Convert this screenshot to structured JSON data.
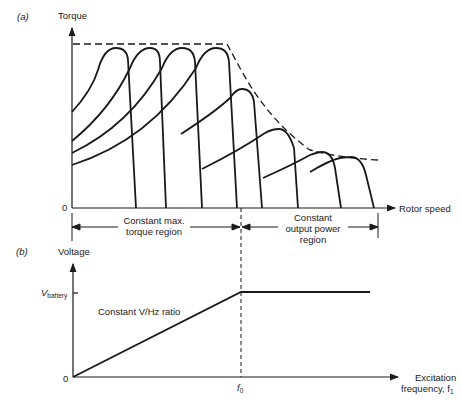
{
  "panel_a": {
    "tag": "(a)",
    "y_axis_label": "Torque",
    "x_axis_label": "Rotor speed",
    "origin_label": "0",
    "region_left": {
      "line1": "Constant max.",
      "line2": "torque region"
    },
    "region_right": {
      "line1": "Constant",
      "line2": "output power",
      "line3": "region"
    }
  },
  "panel_b": {
    "tag": "(b)",
    "y_axis_label": "Voltage",
    "y_tick_label": "V",
    "y_tick_sub": "battery",
    "x_axis_label_line1": "Excitation",
    "x_axis_label_line2": "frequency, f",
    "x_axis_label_sub": "1",
    "origin_label": "0",
    "x_tick_label": "f",
    "x_tick_sub": "0",
    "line_annotation": "Constant V/Hz ratio"
  },
  "colors": {
    "ink": "#1a1a1a",
    "background": "#ffffff"
  }
}
